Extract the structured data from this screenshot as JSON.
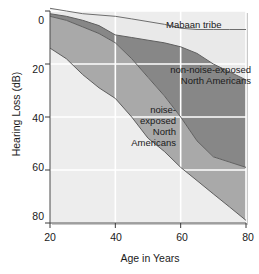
{
  "chart_data": {
    "type": "area",
    "title": "",
    "xlabel": "Age in Years",
    "ylabel": "Hearing Loss (dB)",
    "xlim": [
      20,
      80
    ],
    "ylim": [
      0,
      80
    ],
    "y_inverted": true,
    "grid": true,
    "xticks": [
      20,
      40,
      60,
      80
    ],
    "yticks": [
      0,
      20,
      40,
      60,
      80
    ],
    "xtick_labels": [
      "20",
      "40",
      "60",
      "80"
    ],
    "ytick_labels": [
      "0",
      "20",
      "40",
      "60",
      "80"
    ],
    "legend_position": "inline-annotations",
    "colors": {
      "mabaan_band": "#e9e9e9",
      "non_noise_band": "#878787",
      "noise_band": "#a9a9a9",
      "plot_background": "#ededed",
      "grid": "#ffffff",
      "text": "#1a1a1a"
    },
    "series": [
      {
        "name": "Mabaan tribe",
        "label": "Mabaan tribe",
        "description": "Upper boundary: hearing loss of the Mabaan tribe",
        "x": [
          20,
          25,
          30,
          35,
          40,
          45,
          50,
          55,
          60,
          65,
          70,
          75,
          80
        ],
        "values": [
          -1,
          0,
          1,
          1.5,
          2,
          3,
          4,
          5,
          6.5,
          7,
          7,
          7,
          7
        ]
      },
      {
        "name": "non-noise-exposed North Americans",
        "label": "non-noise-exposed\nNorth Americans",
        "description": "Boundary between Mabaan band and non-noise-exposed North Americans band",
        "x": [
          20,
          25,
          30,
          35,
          40,
          45,
          50,
          55,
          60,
          65,
          70,
          75,
          80
        ],
        "values": [
          1,
          2,
          3.5,
          5.5,
          9,
          10,
          11,
          12,
          13.5,
          16,
          20,
          23,
          26
        ]
      },
      {
        "name": "noise-exposed North Americans",
        "label": "noise-\nexposed\nNorth\nAmericans",
        "description": "Boundary between non-noise-exposed and noise-exposed North Americans bands",
        "x": [
          20,
          25,
          30,
          35,
          40,
          45,
          50,
          55,
          60,
          65,
          70,
          75,
          80
        ],
        "values": [
          2,
          3.5,
          6,
          8.5,
          12,
          18,
          25,
          32,
          40,
          49,
          55,
          57,
          59
        ]
      },
      {
        "name": "noise-exposed lower bound",
        "label": "",
        "description": "Lower boundary of the noise-exposed North Americans band",
        "x": [
          20,
          25,
          30,
          35,
          40,
          45,
          50,
          55,
          60,
          65,
          70,
          75,
          80
        ],
        "values": [
          14,
          18,
          24,
          29,
          33,
          40,
          48,
          53,
          59,
          64,
          69,
          74,
          79
        ]
      }
    ],
    "annotations": [
      {
        "id": "mabaan",
        "text": "Mabaan tribe",
        "lines": [
          "Mabaan tribe"
        ],
        "x": 70,
        "y": 5
      },
      {
        "id": "non-noise-exposed",
        "text": "non-noise-exposed North Americans",
        "lines": [
          "non-noise-exposed",
          "North Americans"
        ],
        "x": 67,
        "y": 24
      },
      {
        "id": "noise-exposed",
        "text": "noise-exposed North Americans",
        "lines": [
          "noise-",
          "exposed",
          "North",
          "Americans"
        ],
        "x": 48,
        "y": 44
      }
    ]
  },
  "caption": {
    "partial_text": ""
  }
}
